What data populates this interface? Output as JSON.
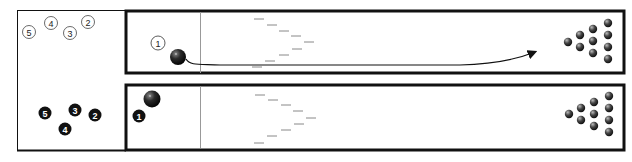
{
  "colors": {
    "frame": "#111111",
    "foul_line": "#888888",
    "arrow_marks": "#777777",
    "ball": "#1a1a1a",
    "pin": "#2a2a2a",
    "background": "#ffffff"
  },
  "legend_top": {
    "style": "outlined-circle",
    "items": [
      {
        "num": "5",
        "x": 29,
        "y": 32
      },
      {
        "num": "4",
        "x": 51,
        "y": 23
      },
      {
        "num": "3",
        "x": 70,
        "y": 33
      },
      {
        "num": "2",
        "x": 88,
        "y": 22
      }
    ]
  },
  "legend_bottom": {
    "style": "filled-circle",
    "items": [
      {
        "num": "5",
        "x": 45,
        "y": 113
      },
      {
        "num": "3",
        "x": 75,
        "y": 110
      },
      {
        "num": "2",
        "x": 95,
        "y": 115
      },
      {
        "num": "4",
        "x": 65,
        "y": 129
      }
    ]
  },
  "lanes": [
    {
      "id": "top",
      "ball_label": "1",
      "ball_label_style": "outlined-circle",
      "ball_label_pos": {
        "x": 158,
        "y": 43
      },
      "ball_pos": {
        "x": 178,
        "y": 57
      },
      "path": "trajectory arrow toward pins"
    },
    {
      "id": "bottom",
      "ball_label": "1",
      "ball_label_style": "filled-circle",
      "ball_label_pos": {
        "x": 139,
        "y": 116
      },
      "ball_pos": {
        "x": 152,
        "y": 100
      }
    }
  ]
}
